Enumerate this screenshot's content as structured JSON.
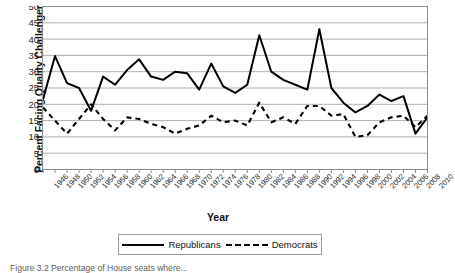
{
  "chart_data": {
    "type": "line",
    "title": "",
    "xlabel": "Year",
    "ylabel": "Percent Facing Quality Challenger",
    "ylim": [
      0,
      50
    ],
    "ytick_step": 5,
    "yticks": [
      0,
      5,
      10,
      15,
      20,
      25,
      30,
      35,
      40,
      45,
      50
    ],
    "grid": true,
    "legend_position": "bottom",
    "categories": [
      "1946",
      "1948",
      "1950",
      "1952",
      "1954",
      "1956",
      "1958",
      "1960",
      "1962",
      "1964",
      "1966",
      "1968",
      "1970",
      "1972",
      "1974",
      "1976",
      "1978",
      "1980",
      "1982",
      "1984",
      "1986",
      "1988",
      "1990",
      "1992",
      "1994",
      "1996",
      "1998",
      "2000",
      "2002",
      "2004",
      "2006",
      "2008",
      "2010"
    ],
    "series": [
      {
        "name": "Republicans",
        "style": "solid",
        "color": "#000000",
        "values": [
          21.5,
          34.8,
          26.5,
          25.0,
          18.0,
          28.5,
          26.0,
          30.5,
          33.8,
          28.5,
          27.5,
          30.0,
          29.5,
          24.5,
          32.5,
          25.5,
          23.5,
          26.0,
          41.2,
          30.0,
          27.5,
          26.0,
          24.5,
          43.0,
          25.0,
          20.5,
          17.5,
          19.5,
          23.0,
          21.0,
          22.5,
          11.0,
          16.0
        ]
      },
      {
        "name": "Democrats",
        "style": "dashed",
        "color": "#000000",
        "values": [
          19.0,
          15.0,
          11.0,
          15.5,
          20.0,
          15.5,
          12.0,
          16.0,
          15.5,
          14.0,
          13.0,
          11.0,
          12.5,
          13.5,
          16.5,
          14.5,
          15.0,
          13.5,
          20.5,
          14.5,
          16.0,
          14.0,
          19.5,
          19.5,
          16.5,
          17.0,
          10.0,
          10.5,
          14.5,
          16.0,
          16.5,
          13.0,
          16.5
        ]
      }
    ]
  },
  "legend": {
    "republicans_label": "Republicans",
    "democrats_label": "Democrats"
  },
  "caption": {
    "text": "Figure 3.2  Percentage of House seats where..."
  }
}
